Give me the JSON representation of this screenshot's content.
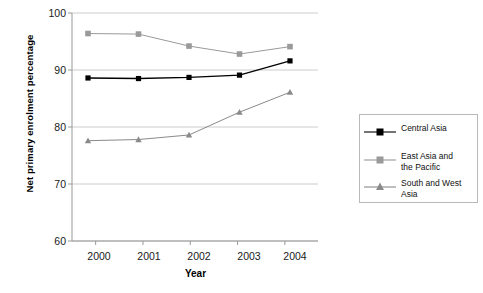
{
  "chart_data": {
    "type": "line",
    "title": "",
    "xlabel": "Year",
    "ylabel": "Net primary enrolment percentage",
    "x": [
      "2000",
      "2001",
      "2002",
      "2003",
      "2004"
    ],
    "categories": [
      "2000",
      "2001",
      "2002",
      "2003",
      "2004"
    ],
    "xlim": [
      1999.6,
      2004.6
    ],
    "ylim": [
      60,
      100
    ],
    "yticks": [
      60,
      70,
      80,
      90,
      100
    ],
    "xticks": [
      "2000",
      "2001",
      "2002",
      "2003",
      "2004"
    ],
    "grid": "horizontal",
    "legend_position": "right-outside",
    "series": [
      {
        "name": "Central Asia",
        "values": [
          88.6,
          88.5,
          88.7,
          89.1,
          91.6
        ],
        "color": "#000000",
        "marker": "diamond"
      },
      {
        "name": "East Asia and the Pacific",
        "values": [
          96.4,
          96.3,
          94.2,
          92.8,
          94.1
        ],
        "color": "#9a9a9a",
        "marker": "square"
      },
      {
        "name": "South and West Asia",
        "values": [
          77.6,
          77.8,
          78.6,
          82.6,
          86.1
        ],
        "color": "#8a8a8a",
        "marker": "triangle"
      }
    ]
  },
  "axes": {
    "ylabel": "Net primary enrolment percentage",
    "xlabel": "Year",
    "ytick_labels": [
      "100",
      "90",
      "80",
      "70",
      "60"
    ],
    "xtick_labels": [
      "2000",
      "2001",
      "2002",
      "2003",
      "2004"
    ]
  },
  "legend": {
    "items": [
      {
        "label": "Central Asia",
        "label_line1": "Central Asia",
        "label_line2": ""
      },
      {
        "label": "East Asia and the Pacific",
        "label_line1": "East Asia and",
        "label_line2": "the Pacific"
      },
      {
        "label": "South and West Asia",
        "label_line1": "South and West",
        "label_line2": "Asia"
      }
    ]
  },
  "colors": {
    "series_1": "#000000",
    "series_2": "#9a9a9a",
    "series_3": "#8a8a8a",
    "grid": "#cccccc",
    "axis": "#999999",
    "legend_border": "#b9b9b9"
  }
}
